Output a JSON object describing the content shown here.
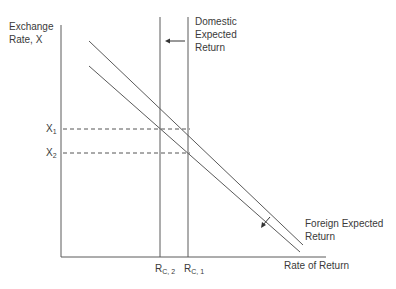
{
  "diagram": {
    "y_axis_label_line1": "Exchange",
    "y_axis_label_line2": "Rate, X",
    "x_axis_label": "Rate of Return",
    "domestic_label_line1": "Domestic",
    "domestic_label_line2": "Expected",
    "domestic_label_line3": "Return",
    "foreign_label_line1": "Foreign Expected",
    "foreign_label_line2": "Return",
    "x1_base": "X",
    "x1_sub": "1",
    "x2_base": "X",
    "x2_sub": "2",
    "rc2_base": "R",
    "rc2_sub": "C, 2",
    "rc1_base": "R",
    "rc1_sub": "C, 1",
    "colors": {
      "line": "#5a5a5a",
      "text": "#3a3a3a",
      "background": "#ffffff"
    }
  }
}
